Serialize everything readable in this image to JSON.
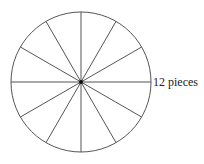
{
  "diagram": {
    "label": "12 pieces",
    "pieces": 12,
    "center": [
      81,
      82
    ],
    "radius": 70,
    "stroke_color": "#555555",
    "center_dot_color": "#111111"
  }
}
